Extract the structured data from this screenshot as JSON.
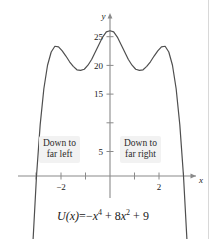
{
  "figure": {
    "title": "",
    "background_color": "#ffffff",
    "curve_color": "#4a4a4a",
    "axis_color": "#777777",
    "callout_bg_color": "#f2f2f2",
    "text_color": "#1a1a1a"
  },
  "equation": {
    "lhs": "U(x)",
    "equals": "=",
    "term1_sign": "−",
    "term1_base": "x",
    "term1_exp": "4",
    "term2_sign": "+",
    "term2_coef": "8",
    "term2_base": "x",
    "term2_exp": "2",
    "term3_sign": "+",
    "term3_value": "9",
    "full_text": "U(x) = −x⁴ + 8x² + 9"
  },
  "callouts": {
    "left": {
      "line1": "Down to",
      "line2": "far left"
    },
    "right": {
      "line1": "Down to",
      "line2": "far right"
    }
  },
  "chart_data": {
    "type": "line",
    "title": "",
    "xlabel": "x",
    "ylabel": "y",
    "function": "U(x) = -x^4 + 8x^2 + 9",
    "xlim": [
      -3.6,
      3.6
    ],
    "ylim": [
      -7,
      29
    ],
    "grid": false,
    "legend": "none",
    "x_ticks": [
      -3,
      -2,
      -1,
      1,
      2,
      3
    ],
    "x_tick_labels": [
      "",
      "−2",
      "",
      "",
      "2",
      ""
    ],
    "y_ticks": [
      5,
      10,
      15,
      20,
      25
    ],
    "y_tick_labels": [
      "5",
      "",
      "15",
      "20",
      "25"
    ],
    "y_tick_label_10_hidden_behind_curve": true,
    "key_points": {
      "local_maxima": [
        {
          "x": -2,
          "y": 25
        },
        {
          "x": 2,
          "y": 25
        }
      ],
      "local_minimum": {
        "x": 0,
        "y": 9
      },
      "x_intercepts": [
        -3,
        3
      ],
      "y_intercept": 9
    },
    "end_behavior": {
      "left": "Down to far left",
      "right": "Down to far right"
    },
    "series": [
      {
        "name": "U(x)",
        "x": [
          -3.45,
          -3.3,
          -3.15,
          -3.0,
          -2.85,
          -2.7,
          -2.55,
          -2.4,
          -2.25,
          -2.1,
          -1.95,
          -1.8,
          -1.65,
          -1.5,
          -1.35,
          -1.2,
          -1.05,
          -0.9,
          -0.75,
          -0.6,
          -0.45,
          -0.3,
          -0.15,
          0,
          0.15,
          0.3,
          0.45,
          0.6,
          0.75,
          0.9,
          1.05,
          1.2,
          1.35,
          1.5,
          1.65,
          1.8,
          1.95,
          2.1,
          2.25,
          2.4,
          2.55,
          2.7,
          2.85,
          3.0,
          3.15,
          3.3,
          3.45
        ],
        "y": [
          -46.5,
          -27.5,
          -11.9,
          0,
          8.9,
          15.2,
          19.3,
          21.6,
          22.6,
          22.5,
          21.8,
          20.9,
          19.9,
          19.1,
          18.5,
          18.4,
          18.6,
          19.3,
          20.3,
          21.6,
          22.9,
          24.2,
          25.1,
          25.3,
          25.1,
          24.2,
          22.9,
          21.6,
          20.3,
          19.3,
          18.6,
          18.4,
          18.5,
          19.1,
          19.9,
          20.9,
          21.8,
          22.5,
          22.6,
          21.6,
          19.3,
          15.2,
          8.9,
          0,
          -11.9,
          -27.5,
          -46.5
        ]
      }
    ],
    "note": "Curve is plotted as V(x) shape: graph shown is U(x) = -x^4 + 8x^2 + 9 with maxima 25 at x=±2 and local min 9 at x=0"
  }
}
